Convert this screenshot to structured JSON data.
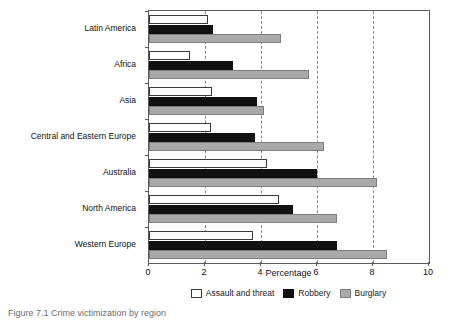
{
  "chart_data": {
    "type": "bar",
    "orientation": "horizontal",
    "title": "",
    "xlabel": "Percentage",
    "ylabel": "",
    "xlim": [
      0,
      10
    ],
    "xticks": [
      0,
      2,
      4,
      6,
      8,
      10
    ],
    "xtick_labels": [
      "0",
      "2",
      "4",
      "6",
      "8",
      "10"
    ],
    "grid": "vertical-dashed",
    "legend_position": "bottom-center",
    "categories": [
      "Latin America",
      "Africa",
      "Asia",
      "Central and Eastern Europe",
      "Australia",
      "North America",
      "Western Europe"
    ],
    "series": [
      {
        "name": "Assault and threat",
        "color": "#ffffff",
        "values": [
          2.1,
          1.45,
          2.25,
          2.2,
          4.2,
          4.65,
          3.7
        ]
      },
      {
        "name": "Robbery",
        "color": "#111111",
        "values": [
          2.3,
          3.0,
          3.85,
          3.8,
          6.0,
          5.15,
          6.7
        ]
      },
      {
        "name": "Burglary",
        "color": "#a9a9a9",
        "values": [
          4.7,
          5.7,
          4.1,
          6.25,
          8.15,
          6.7,
          8.5
        ]
      }
    ]
  },
  "legend": {
    "items": [
      {
        "label": "Assault and threat",
        "key": "assault"
      },
      {
        "label": "Robbery",
        "key": "robbery"
      },
      {
        "label": "Burglary",
        "key": "burglary"
      }
    ]
  },
  "caption": {
    "text": "Figure 7.1 Crime victimization by region"
  }
}
